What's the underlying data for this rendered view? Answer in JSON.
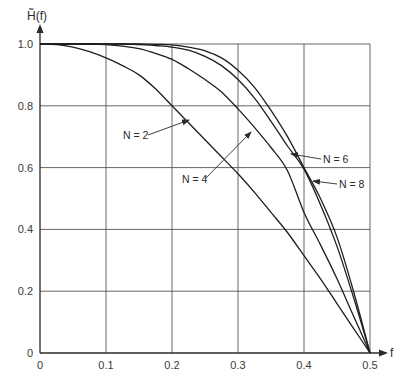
{
  "chart_data": {
    "type": "line",
    "title": "",
    "xlabel": "f",
    "ylabel": "H̃(f)",
    "xlim": [
      0,
      0.5
    ],
    "ylim": [
      0,
      1.0
    ],
    "grid": true,
    "legend": "inline labels with arrows",
    "x_ticks": [
      "0",
      "0.1",
      "0.2",
      "0.3",
      "0.4",
      "0.5"
    ],
    "y_ticks": [
      "0",
      "0.2",
      "0.4",
      "0.6",
      "0.8",
      "1.0"
    ],
    "x_origin_label": "0",
    "x": [
      0,
      0.025,
      0.05,
      0.075,
      0.1,
      0.125,
      0.15,
      0.175,
      0.2,
      0.225,
      0.25,
      0.275,
      0.3,
      0.325,
      0.35,
      0.375,
      0.4,
      0.425,
      0.45,
      0.475,
      0.5
    ],
    "series": [
      {
        "name": "N = 2",
        "values": [
          1.0,
          0.998,
          0.99,
          0.975,
          0.955,
          0.93,
          0.9,
          0.855,
          0.8,
          0.745,
          0.69,
          0.635,
          0.58,
          0.52,
          0.455,
          0.39,
          0.315,
          0.24,
          0.16,
          0.08,
          0.0
        ]
      },
      {
        "name": "N = 4",
        "values": [
          1.0,
          1.0,
          1.0,
          1.0,
          0.998,
          0.993,
          0.985,
          0.97,
          0.95,
          0.92,
          0.885,
          0.845,
          0.79,
          0.73,
          0.665,
          0.59,
          0.455,
          0.35,
          0.24,
          0.12,
          0.0
        ]
      },
      {
        "name": "N = 6",
        "values": [
          1.0,
          1.0,
          1.0,
          1.0,
          1.0,
          1.0,
          0.998,
          0.995,
          0.99,
          0.98,
          0.96,
          0.93,
          0.885,
          0.825,
          0.75,
          0.67,
          0.595,
          0.48,
          0.345,
          0.18,
          0.0
        ]
      },
      {
        "name": "N = 8",
        "values": [
          1.0,
          1.0,
          1.0,
          1.0,
          1.0,
          1.0,
          1.0,
          0.999,
          0.997,
          0.99,
          0.978,
          0.955,
          0.915,
          0.86,
          0.785,
          0.7,
          0.6,
          0.5,
          0.375,
          0.2,
          0.0
        ]
      }
    ],
    "annotations": [
      {
        "text": "N = 2",
        "target_series": "N = 2"
      },
      {
        "text": "N = 4",
        "target_series": "N = 4"
      },
      {
        "text": "N = 6",
        "target_series": "N = 6"
      },
      {
        "text": "N = 8",
        "target_series": "N = 8"
      }
    ]
  }
}
